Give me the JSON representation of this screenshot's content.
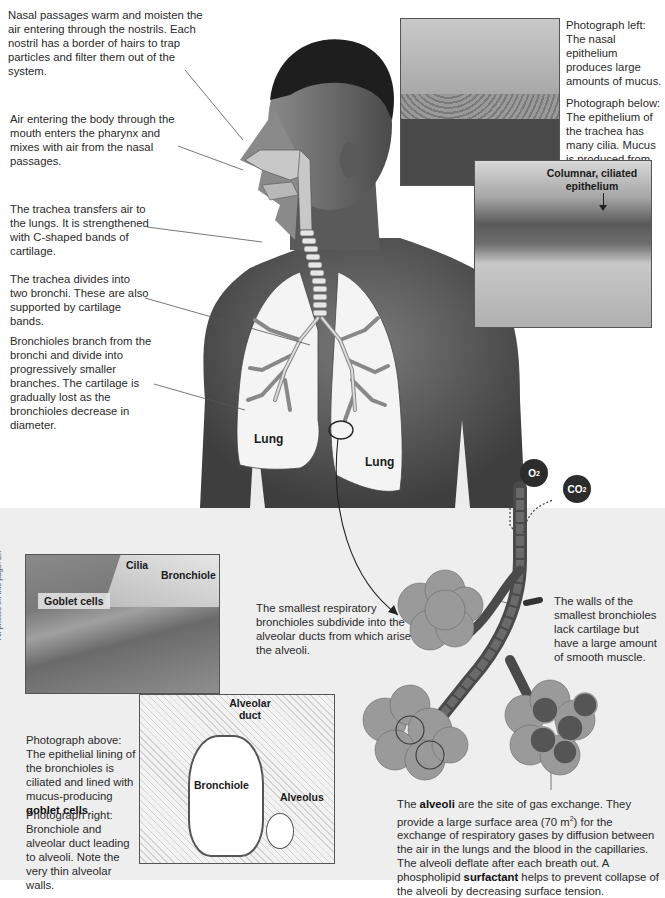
{
  "top_callouts": {
    "nasal": "Nasal passages warm and moisten the air entering through the nostrils. Each nostril has a border of hairs to trap particles and filter them out of the system.",
    "mouth": "Air entering the body through the mouth enters the pharynx and mixes with air from the nasal passages.",
    "trachea": "The trachea transfers air to the lungs. It is strengthened with C-shaped bands of cartilage.",
    "bronchi": "The trachea divides into two bronchi. These are also supported by cartilage bands.",
    "bronchioles": "Bronchioles branch from the bronchi and divide into progressively smaller branches. The cartilage is gradually lost as the bronchioles decrease in diameter."
  },
  "body_labels": {
    "lung_left": "Lung",
    "lung_right": "Lung"
  },
  "photo_captions": {
    "nasal_left": "Photograph left: The nasal epithelium produces large amounts of mucus.",
    "trachea_below": "Photograph below: The epithelium of the trachea has many cilia. Mucus is produced from goblet cells.",
    "trachea_photo_label": "Columnar, ciliated epithelium"
  },
  "gases": {
    "o2": "O",
    "o2_sub": "2",
    "co2": "CO",
    "co2_sub": "2"
  },
  "bottom_left": {
    "photo_labels": {
      "cilia": "Cilia",
      "bronchiole": "Bronchiole",
      "goblet": "Goblet cells"
    },
    "caption_above_prefix": "Photograph above: The epithelial lining of the bronchioles is ciliated and lined with mucus-producing ",
    "caption_above_bold": "goblet cells",
    "caption_above_suffix": ".",
    "caption_right": "Photograph right: Bronchiole and alveolar duct leading to alveoli. Note the very thin alveolar walls.",
    "credit": "All photos on this page: EII"
  },
  "alveolar_photo_labels": {
    "duct": "Alveolar duct",
    "bronchiole": "Bronchiole",
    "alveolus": "Alveolus"
  },
  "alveoli_callouts": {
    "smallest": "The smallest respiratory bronchioles subdivide into the alveolar ducts from which arise the alveoli.",
    "walls": "The walls of the smallest bronchioles lack cartilage but have a large amount of smooth muscle.",
    "main_p1": "The ",
    "main_b1": "alveoli",
    "main_p2": " are the site of gas exchange. They provide a large surface area (70 m",
    "main_sup": "2",
    "main_p3": ") for the exchange of respiratory gases by diffusion between the air in the lungs and the blood in the capillaries. The alveoli deflate after each breath out. A phospholipid ",
    "main_b2": "surfactant",
    "main_p4": " helps to prevent collapse of the alveoli by decreasing surface tension."
  },
  "colors": {
    "skin": "#5e5e5e",
    "lung_fill": "#f4f4f4",
    "panel_bg": "#eeeeee",
    "airway": "#c8c8c8"
  }
}
